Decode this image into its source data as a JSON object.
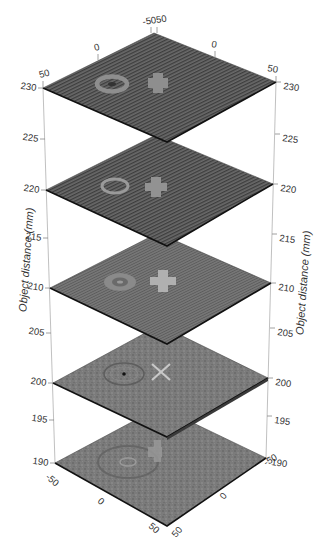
{
  "figure": {
    "type": "3d stacked image slices",
    "z_axis": {
      "title": "Object distance (mm)",
      "ticks": [
        "190",
        "195",
        "200",
        "205",
        "210",
        "215",
        "220",
        "225",
        "230"
      ]
    },
    "x_axis": {
      "ticks": [
        "-50",
        "0",
        "50"
      ]
    },
    "y_axis": {
      "ticks": [
        "-50",
        "0",
        "50"
      ]
    },
    "top_corner_label": "-5050",
    "bottom_right_corner_label": "-5190",
    "slices": [
      {
        "z": "230",
        "features": [
          "ring",
          "blurred cross"
        ]
      },
      {
        "z": "220",
        "features": [
          "ring",
          "blurred cross"
        ]
      },
      {
        "z": "210",
        "features": [
          "ring",
          "cross"
        ]
      },
      {
        "z": "200",
        "features": [
          "ring with dot",
          "sharp X"
        ]
      },
      {
        "z": "190",
        "features": [
          "blurred ring",
          "blurred cross"
        ]
      }
    ]
  },
  "labels": {
    "left": {
      "z230": "230",
      "z225": "225",
      "z220": "220",
      "z215": "215",
      "z210": "210",
      "z205": "205",
      "z200": "200",
      "z195": "195",
      "z190": "190"
    },
    "right": {
      "z230": "230",
      "z225": "225",
      "z220": "220",
      "z215": "215",
      "z210": "210",
      "z205": "205",
      "z200": "200",
      "z195": "195",
      "z190": "190"
    },
    "top": {
      "x_left": "50",
      "x_mid": "0",
      "corner": "-5050",
      "y_mid": "0",
      "y_right": "50"
    },
    "bottom": {
      "x_left": "-50",
      "x_mid": "0",
      "x_near": "50",
      "y_near": "50",
      "y_mid": "0",
      "y_far": "-50"
    },
    "axis_title_left": "Object distance (mm)",
    "axis_title_right": "Object distance (mm)"
  }
}
